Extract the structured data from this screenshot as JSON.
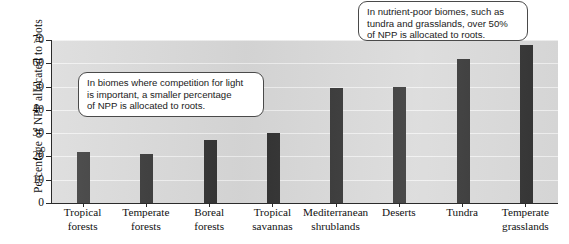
{
  "chart_data": {
    "type": "bar",
    "title": "",
    "xlabel": "",
    "ylabel": "Percentage of NPP allocated to roots",
    "ylim": [
      0,
      70
    ],
    "yticks": [
      0,
      10,
      20,
      30,
      40,
      50,
      60,
      70
    ],
    "grid": true,
    "legend": "none",
    "bar_color": "#323232",
    "plot_background": "#d9d9d9",
    "categories": [
      "Tropical forests",
      "Temperate forests",
      "Boreal forests",
      "Tropical savannas",
      "Mediterranean shrublands",
      "Deserts",
      "Tundra",
      "Temperate grasslands"
    ],
    "category_lines": [
      {
        "line1": "Tropical",
        "line2": "forests"
      },
      {
        "line1": "Temperate",
        "line2": "forests"
      },
      {
        "line1": "Boreal",
        "line2": "forests"
      },
      {
        "line1": "Tropical",
        "line2": "savannas"
      },
      {
        "line1": "Mediterranean",
        "line2": "shrublands"
      },
      {
        "line1": "Deserts",
        "line2": ""
      },
      {
        "line1": "Tundra",
        "line2": ""
      },
      {
        "line1": "Temperate",
        "line2": "grasslands"
      }
    ],
    "values": [
      22,
      21,
      27,
      30,
      49.5,
      50,
      62,
      68
    ],
    "annotations": [
      {
        "id": "callout-left",
        "lines": [
          "In biomes where competition for light",
          "is important, a smaller percentage",
          "of NPP is allocated to roots."
        ]
      },
      {
        "id": "callout-right",
        "lines": [
          "In nutrient-poor biomes, such as",
          "tundra and grasslands, over 50%",
          "of NPP is allocated to roots."
        ]
      }
    ]
  }
}
